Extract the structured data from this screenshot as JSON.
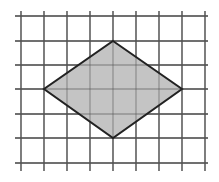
{
  "diagram": {
    "type": "grid-with-shape",
    "shape": "rhombus",
    "grid": {
      "vertical_x": [
        21,
        44,
        67,
        90,
        113,
        136,
        159,
        182,
        205
      ],
      "horizontal_y": [
        16,
        41,
        65,
        89,
        114,
        138,
        163
      ],
      "x_extent": [
        15,
        208
      ],
      "y_extent": [
        11,
        171
      ],
      "line_color": "#555555"
    },
    "rhombus": {
      "vertices": [
        [
          113,
          41
        ],
        [
          182,
          89
        ],
        [
          113,
          138
        ],
        [
          44,
          89
        ]
      ],
      "fill": "#c4c4c4",
      "stroke": "#222222"
    }
  }
}
